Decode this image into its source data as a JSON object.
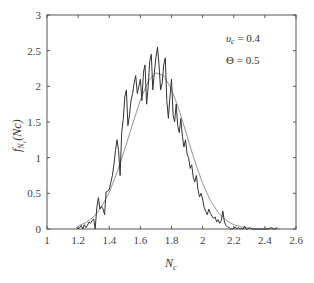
{
  "chart_data": {
    "type": "line",
    "title": "",
    "xlabel": "N_c",
    "ylabel": "f_{N_c}(Nc)",
    "xlim": [
      1,
      2.6
    ],
    "ylim": [
      0,
      3
    ],
    "xticks": [
      1,
      1.2,
      1.4,
      1.6,
      1.8,
      2,
      2.2,
      2.4,
      2.6
    ],
    "xtick_labels": [
      "1",
      "1.2",
      "1.4",
      "1.6",
      "1.8",
      "2",
      "2.2",
      "2.4",
      "2.6"
    ],
    "yticks": [
      0,
      0.5,
      1,
      1.5,
      2,
      2.5,
      3
    ],
    "ytick_labels": [
      "0",
      "0.5",
      "1",
      "1.5",
      "2",
      "2.5",
      "3"
    ],
    "grid": false,
    "annotations": [
      "υ_c = 0.4",
      "Θ = 0.5"
    ],
    "series": [
      {
        "name": "empirical histogram",
        "x": [
          1.19,
          1.2,
          1.21,
          1.22,
          1.23,
          1.24,
          1.25,
          1.26,
          1.27,
          1.28,
          1.29,
          1.3,
          1.31,
          1.32,
          1.33,
          1.34,
          1.35,
          1.36,
          1.37,
          1.38,
          1.39,
          1.4,
          1.41,
          1.42,
          1.43,
          1.44,
          1.45,
          1.46,
          1.47,
          1.48,
          1.49,
          1.5,
          1.51,
          1.52,
          1.53,
          1.54,
          1.55,
          1.56,
          1.57,
          1.58,
          1.59,
          1.6,
          1.61,
          1.62,
          1.63,
          1.64,
          1.65,
          1.66,
          1.67,
          1.68,
          1.69,
          1.7,
          1.71,
          1.72,
          1.73,
          1.74,
          1.75,
          1.76,
          1.77,
          1.78,
          1.79,
          1.8,
          1.81,
          1.82,
          1.83,
          1.84,
          1.85,
          1.86,
          1.87,
          1.88,
          1.89,
          1.9,
          1.91,
          1.92,
          1.93,
          1.94,
          1.95,
          1.96,
          1.97,
          1.98,
          1.99,
          2.0,
          2.01,
          2.02,
          2.03,
          2.04,
          2.05,
          2.06,
          2.07,
          2.08,
          2.09,
          2.1,
          2.11,
          2.12,
          2.13,
          2.14,
          2.15,
          2.16,
          2.17,
          2.18,
          2.19,
          2.2,
          2.21,
          2.22,
          2.23,
          2.24,
          2.25,
          2.26,
          2.27,
          2.28,
          2.29,
          2.3,
          2.32,
          2.34,
          2.36,
          2.38,
          2.4,
          2.42,
          2.44,
          2.46,
          2.48
        ],
        "y": [
          0.03,
          0.0,
          0.02,
          0.05,
          0.0,
          0.06,
          0.02,
          0.05,
          0.1,
          0.08,
          0.12,
          0.14,
          0.0,
          0.3,
          0.44,
          0.28,
          0.32,
          0.28,
          0.2,
          0.52,
          0.53,
          0.55,
          0.65,
          0.75,
          0.9,
          1.1,
          1.25,
          1.1,
          0.75,
          1.35,
          1.55,
          1.85,
          1.95,
          1.45,
          1.6,
          1.8,
          1.9,
          2.05,
          2.15,
          1.9,
          2.0,
          2.1,
          1.8,
          2.2,
          2.3,
          1.75,
          2.0,
          2.35,
          2.45,
          1.95,
          2.2,
          2.4,
          2.55,
          2.3,
          1.95,
          2.05,
          2.3,
          2.4,
          1.8,
          1.55,
          1.85,
          2.1,
          1.6,
          1.5,
          1.75,
          1.45,
          1.35,
          1.55,
          1.3,
          1.15,
          1.25,
          1.05,
          1.0,
          0.85,
          0.9,
          0.72,
          0.66,
          0.75,
          0.55,
          0.45,
          0.5,
          0.42,
          0.3,
          0.25,
          0.2,
          0.28,
          0.22,
          0.18,
          0.15,
          0.17,
          0.1,
          0.13,
          0.08,
          0.12,
          0.25,
          0.1,
          0.05,
          0.03,
          0.02,
          0.0,
          0.0,
          0.01,
          0.03,
          0.0,
          0.02,
          0.0,
          0.01,
          0.0,
          0.04,
          0.0,
          0.0,
          0.02,
          0.0,
          0.0,
          0.0,
          0.0,
          0.0,
          0.0,
          0.02,
          0.0,
          0.02
        ]
      },
      {
        "name": "fitted density",
        "x": [
          1.2,
          1.25,
          1.3,
          1.35,
          1.4,
          1.45,
          1.5,
          1.55,
          1.6,
          1.65,
          1.7,
          1.75,
          1.8,
          1.85,
          1.9,
          1.95,
          2.0,
          2.05,
          2.1,
          2.15,
          2.2,
          2.25,
          2.3,
          2.35,
          2.4,
          2.45,
          2.5
        ],
        "y": [
          0.04,
          0.09,
          0.17,
          0.31,
          0.51,
          0.79,
          1.12,
          1.47,
          1.81,
          2.07,
          2.19,
          2.15,
          1.96,
          1.66,
          1.3,
          0.95,
          0.64,
          0.4,
          0.23,
          0.12,
          0.06,
          0.03,
          0.01,
          0.0,
          0.0,
          0.0,
          0.0
        ]
      }
    ]
  },
  "labels": {
    "xlabel_main": "N",
    "xlabel_sub": "c",
    "ylabel_f": "f",
    "ylabel_sub": "N",
    "ylabel_subsub": "c",
    "ylabel_arg": "(Nc)",
    "annot1_var": "υ",
    "annot1_sub": "c",
    "annot1_val": " = 0.4",
    "annot2": "Θ = 0.5"
  }
}
